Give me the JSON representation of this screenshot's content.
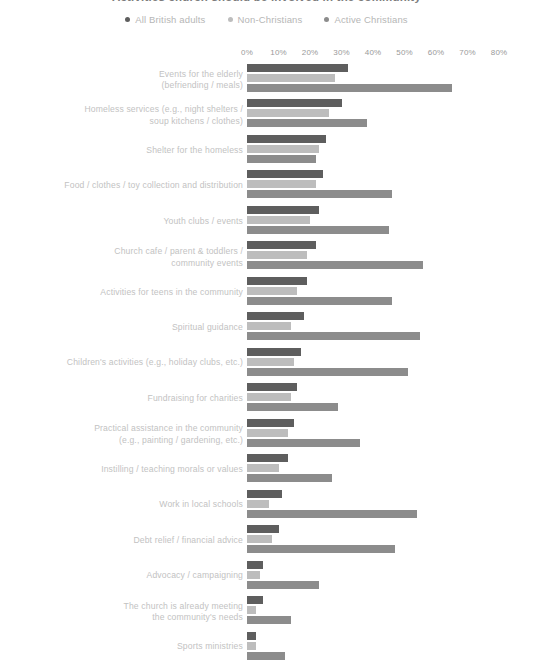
{
  "title": "Activities church should be involved in the community",
  "legend": {
    "position": "top-center",
    "items": [
      {
        "label": "All British adults",
        "color": "#5e5e5e",
        "icon": "dot-icon"
      },
      {
        "label": "Non-Christians",
        "color": "#bdbdbd",
        "icon": "dot-icon"
      },
      {
        "label": "Active Christians",
        "color": "#8c8c8c",
        "icon": "dot-icon"
      }
    ]
  },
  "chart_data": {
    "type": "bar",
    "orientation": "horizontal",
    "title": "Activities church should be involved in the community",
    "xlabel": "",
    "ylabel": "",
    "xlim": [
      0,
      80
    ],
    "grid": false,
    "tick_labels": [
      "0%",
      "10%",
      "20%",
      "30%",
      "40%",
      "50%",
      "60%",
      "70%",
      "80%"
    ],
    "tick_values": [
      0,
      10,
      20,
      30,
      40,
      50,
      60,
      70,
      80
    ],
    "categories": [
      "Events for the elderly (befriending / meals)",
      "Homeless services (e.g., night shelters / soup kitchens / clothes)",
      "Shelter for the homeless",
      "Food / clothes / toy collection and distribution",
      "Youth clubs / events",
      "Church cafe / parent & toddlers / community events",
      "Activities for teens in the community",
      "Spiritual guidance",
      "Children's activities (e.g., holiday clubs, etc.)",
      "Fundraising for charities",
      "Practical assistance in the community (e.g., painting / gardening, etc.)",
      "Instilling / teaching morals or values",
      "Work in local schools",
      "Debt relief / financial advice",
      "Advocacy / campaigning",
      "The church is already meeting the community's needs",
      "Sports ministries"
    ],
    "category_lines": [
      [
        "Events for the elderly",
        "(befriending / meals)"
      ],
      [
        "Homeless services (e.g., night shelters /",
        "soup kitchens / clothes)"
      ],
      [
        "Shelter for the homeless"
      ],
      [
        "Food / clothes / toy collection and distribution"
      ],
      [
        "Youth clubs / events"
      ],
      [
        "Church cafe / parent & toddlers /",
        "community events"
      ],
      [
        "Activities for teens in the community"
      ],
      [
        "Spiritual guidance"
      ],
      [
        "Children's activities (e.g., holiday clubs, etc.)"
      ],
      [
        "Fundraising for charities"
      ],
      [
        "Practical assistance in the community",
        "(e.g., painting / gardening, etc.)"
      ],
      [
        "Instilling / teaching morals or values"
      ],
      [
        "Work in local schools"
      ],
      [
        "Debt relief / financial advice"
      ],
      [
        "Advocacy / campaigning"
      ],
      [
        "The church is already meeting",
        "the community's needs"
      ],
      [
        "Sports ministries"
      ]
    ],
    "series": [
      {
        "name": "All British adults",
        "color": "#5e5e5e",
        "values": [
          32,
          30,
          25,
          24,
          23,
          22,
          19,
          18,
          17,
          16,
          15,
          13,
          11,
          10,
          5,
          5,
          3
        ]
      },
      {
        "name": "Non-Christians",
        "color": "#bdbdbd",
        "values": [
          28,
          26,
          23,
          22,
          20,
          19,
          16,
          14,
          15,
          14,
          13,
          10,
          7,
          8,
          4,
          3,
          3
        ]
      },
      {
        "name": "Active Christians",
        "color": "#8c8c8c",
        "values": [
          65,
          38,
          22,
          46,
          45,
          56,
          46,
          55,
          51,
          29,
          36,
          27,
          54,
          47,
          23,
          14,
          12
        ]
      }
    ]
  }
}
